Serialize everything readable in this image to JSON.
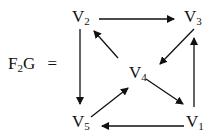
{
  "graph": {
    "name_main": "F",
    "name_sub": "2",
    "name_tail": "G",
    "equals": "=",
    "nodes": [
      {
        "id": "V1",
        "base": "V",
        "sub": "1",
        "x": 193,
        "y": 122
      },
      {
        "id": "V2",
        "base": "V",
        "sub": "2",
        "x": 80,
        "y": 17
      },
      {
        "id": "V3",
        "base": "V",
        "sub": "3",
        "x": 193,
        "y": 17
      },
      {
        "id": "V4",
        "base": "V",
        "sub": "4",
        "x": 137,
        "y": 73
      },
      {
        "id": "V5",
        "base": "V",
        "sub": "5",
        "x": 80,
        "y": 122
      }
    ],
    "edges": [
      {
        "from": "V2",
        "to": "V3"
      },
      {
        "from": "V2",
        "to": "V5"
      },
      {
        "from": "V4",
        "to": "V2"
      },
      {
        "from": "V3",
        "to": "V4"
      },
      {
        "from": "V4",
        "to": "V1"
      },
      {
        "from": "V5",
        "to": "V4"
      },
      {
        "from": "V1",
        "to": "V3"
      },
      {
        "from": "V1",
        "to": "V5"
      }
    ]
  }
}
